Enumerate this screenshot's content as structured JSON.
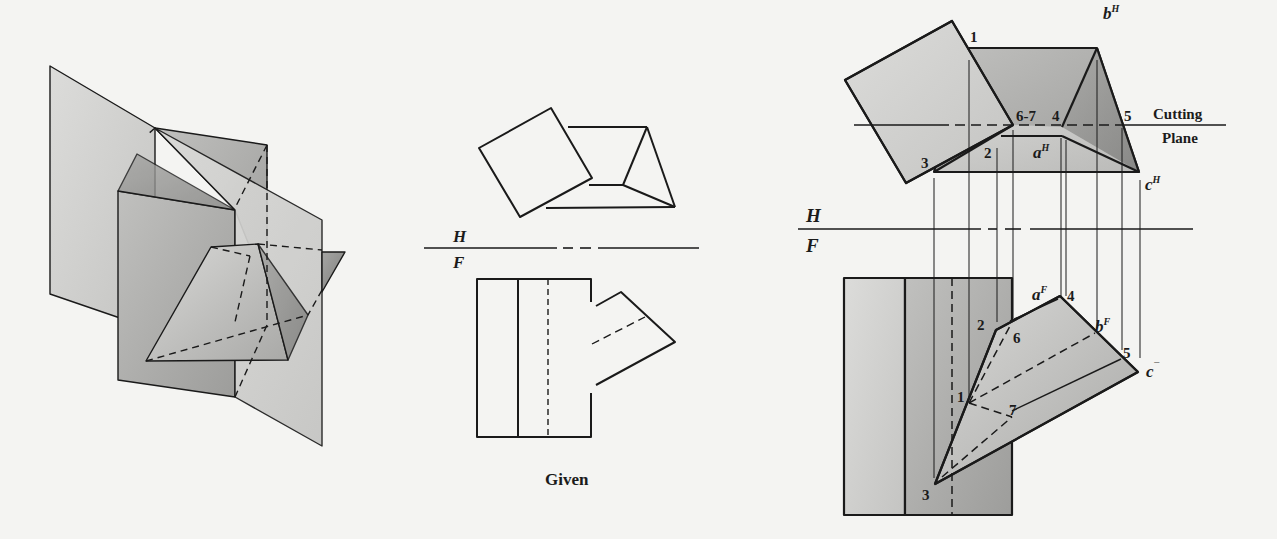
{
  "figure": {
    "pictorial_view": {
      "description": "Isometric view of vertical prism intersected by inclined triangular prism with cutting planes"
    },
    "given_view": {
      "caption": "Given",
      "plane_labels": {
        "top": "H",
        "bottom": "F"
      }
    },
    "solution_view": {
      "plane_labels": {
        "top": "H",
        "bottom": "F"
      },
      "cutting_plane_label_line1": "Cutting",
      "cutting_plane_label_line2": "Plane",
      "top_view_points": {
        "p1": "1",
        "p2": "2",
        "p3": "3",
        "p4": "4",
        "p5": "5",
        "p67": "6-7",
        "a": {
          "base": "a",
          "sup": "H"
        },
        "b": {
          "base": "b",
          "sup": "H"
        },
        "c": {
          "base": "c",
          "sup": "H"
        }
      },
      "front_view_points": {
        "p1": "1",
        "p2": "2",
        "p3": "3",
        "p4": "4",
        "p5": "5",
        "p6": "6",
        "p7": "7",
        "a": {
          "base": "a",
          "sup": "F"
        },
        "b": {
          "base": "b",
          "sup": "F"
        },
        "c": {
          "base": "c",
          "sup": "¯"
        }
      }
    }
  },
  "colors": {
    "background": "#f4f4f2",
    "line": "#1a1a1a",
    "shade_light": "#d2d2d0",
    "shade_mid": "#b5b5b3",
    "shade_dark": "#8e8e8c"
  }
}
